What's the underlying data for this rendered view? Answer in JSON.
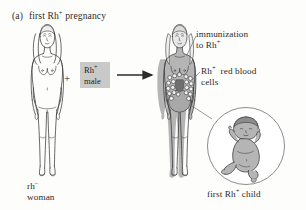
{
  "figure": {
    "panel_letter": "(a)",
    "title": "first Rh",
    "title_sup": "+",
    "title_tail": " pregnancy",
    "title_full": "(a)  first Rh+ pregnancy",
    "background_color": "#fdfdfc",
    "line_color": "#2b2b2b",
    "shade_color": "#b0b0b0",
    "box_color": "#c9c9c9"
  },
  "labels": {
    "immunization": {
      "line1": "immunization",
      "line2": "to Rh",
      "sup": "+"
    },
    "red_blood_cells": {
      "line1": "Rh",
      "sup": "+",
      "line1_tail": "  red blood",
      "line2": "cells"
    },
    "rh_negative_woman": {
      "line1": "rh",
      "sup": "–",
      "line2": "woman"
    },
    "first_child": {
      "text": "first Rh",
      "sup": "+",
      "tail": " child"
    }
  },
  "male_box": {
    "line1": "Rh",
    "sup": "+",
    "line2": "male"
  },
  "operator": {
    "plus": "+"
  },
  "figures": {
    "woman_left": "unshaded-line-drawing-standing-woman",
    "woman_right": "shaded-pregnant-woman-with-red-blood-cells",
    "baby_inset": "shaded-seated-infant-in-circle"
  }
}
